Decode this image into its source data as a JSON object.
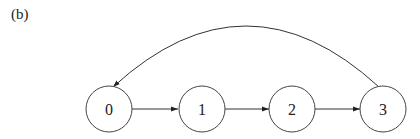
{
  "figure": {
    "panel_label": "(b)"
  },
  "diagram": {
    "type": "directed-graph",
    "nodes": [
      {
        "id": "0",
        "label": "0"
      },
      {
        "id": "1",
        "label": "1"
      },
      {
        "id": "2",
        "label": "2"
      },
      {
        "id": "3",
        "label": "3"
      }
    ],
    "edges": [
      {
        "from": "0",
        "to": "1",
        "shape": "straight"
      },
      {
        "from": "1",
        "to": "2",
        "shape": "straight"
      },
      {
        "from": "2",
        "to": "3",
        "shape": "straight"
      },
      {
        "from": "3",
        "to": "0",
        "shape": "arc-over"
      }
    ],
    "colors": {
      "stroke": "#333333",
      "background": "#ffffff"
    }
  }
}
